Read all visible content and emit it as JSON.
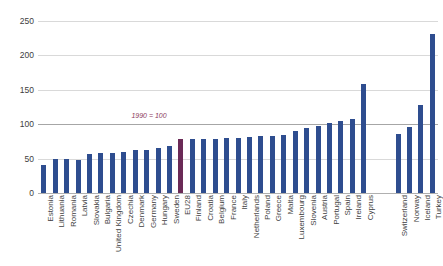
{
  "chart_data": {
    "type": "bar",
    "title": "",
    "subtitle": "",
    "xlabel": "",
    "ylabel": "",
    "ylim": [
      0,
      250
    ],
    "yticks": [
      0,
      50,
      100,
      150,
      200,
      250
    ],
    "grid": true,
    "legend": "none",
    "annotations": [
      {
        "text": "1990 = 100",
        "value": 100,
        "near_category": "Sweden"
      }
    ],
    "highlight_category": "EU28",
    "colors": {
      "bar": "#2e4d8f",
      "highlight_bar": "#6b2a57",
      "annotation": "#8d3b5e",
      "gridline": "#d9d9d9",
      "baseline": "#b0b0b0",
      "text": "#404040"
    },
    "groups": [
      {
        "name": "EU and members",
        "categories": [
          "Estonia",
          "Lithuania",
          "Romania",
          "Latvia",
          "Slovakia",
          "Bulgaria",
          "United Kingdom",
          "Czechia",
          "Denmark",
          "Germany",
          "Hungary",
          "Sweden",
          "EU28",
          "Finland",
          "Croatia",
          "Belgium",
          "France",
          "Italy",
          "Netherlands",
          "Poland",
          "Greece",
          "Malta",
          "Luxembourg",
          "Slovenia",
          "Austria",
          "Portugal",
          "Spain",
          "Ireland",
          "Cyprus"
        ],
        "values": [
          41,
          49,
          49,
          48,
          57,
          58,
          58,
          60,
          63,
          63,
          65,
          68,
          78,
          78,
          78,
          79,
          80,
          80,
          82,
          83,
          83,
          85,
          90,
          95,
          98,
          102,
          104,
          107,
          158
        ]
      },
      {
        "name": "Non-EU",
        "categories": [
          "Switzerland",
          "Norway",
          "Iceland",
          "Turkey"
        ],
        "values": [
          86,
          96,
          128,
          231
        ]
      }
    ]
  }
}
